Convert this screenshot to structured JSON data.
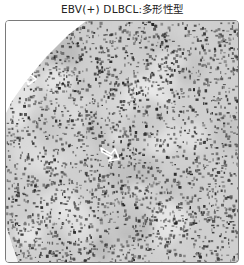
{
  "figure": {
    "title": "EBV(+) DLBCL:多形性型",
    "image": {
      "description": "Grayscale histology micrograph showing dense polymorphous lymphoid infiltrate",
      "annotations": [
        {
          "type": "arrow",
          "direction": "right",
          "color": "#ffffff",
          "position": "upper-left"
        },
        {
          "type": "arrow",
          "direction": "right",
          "color": "#ffffff",
          "position": "center"
        }
      ],
      "colors": {
        "background": "#d9d9d9",
        "nuclei": "#333333",
        "border": "#7a7a7a"
      }
    }
  }
}
